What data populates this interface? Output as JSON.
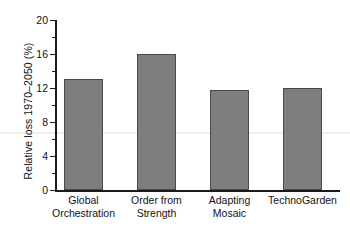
{
  "chart_data": {
    "type": "bar",
    "title": "",
    "xlabel": "",
    "ylabel": "Relative loss 1970–2050 (%)",
    "categories": [
      "Global Orchestration",
      "Order from Strength",
      "Adapting Mosaic",
      "TechnoGarden"
    ],
    "category_lines": [
      [
        "Global",
        "Orchestration"
      ],
      [
        "Order from",
        "Strength"
      ],
      [
        "Adapting",
        "Mosaic"
      ],
      [
        "TechnoGarden"
      ]
    ],
    "values": [
      13.1,
      16.0,
      11.8,
      12.0
    ],
    "ylim": [
      0,
      20
    ],
    "yticks": [
      0,
      4,
      8,
      12,
      16,
      20
    ],
    "ytick_labels": [
      "0",
      "4",
      "8",
      "12",
      "16",
      "20"
    ],
    "yminor_ticks": [
      2,
      6,
      10,
      14,
      18
    ],
    "grid": false,
    "legend": null,
    "bar_color": "#7e7e7e",
    "bar_edge_color": "#4a4a4a",
    "axis_color": "#1a1a1a",
    "background": "#ffffff"
  }
}
